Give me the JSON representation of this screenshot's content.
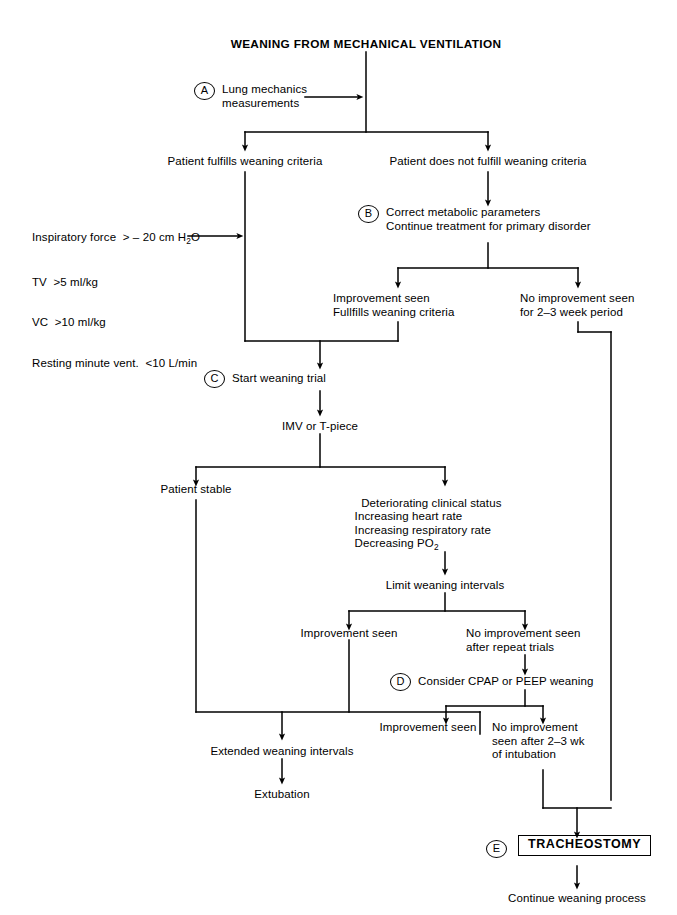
{
  "diagram": {
    "title": "WEANING FROM MECHANICAL VENTILATION",
    "type": "clinical-algorithm-flowchart",
    "markers": {
      "a": "A",
      "b": "B",
      "c": "C",
      "d": "D",
      "e": "E"
    },
    "nodes": {
      "lung_mechanics": "Lung mechanics\nmeasurements",
      "fulfills": "Patient fulfills weaning criteria",
      "not_fulfills": "Patient does not fulfill weaning criteria",
      "criteria_line1": "Inspiratory force  > – 20 cm H",
      "criteria_line1_sub": "2",
      "criteria_line1_end": "O",
      "criteria_line2": "TV  >5 ml/kg",
      "criteria_line3": "VC  >10 ml/kg",
      "criteria_line4": "Resting minute vent.  <10 L/min",
      "correct_metabolic": "Correct metabolic parameters\nContinue treatment for primary disorder",
      "improvement_fulfills": "Improvement seen\nFullfills weaning criteria",
      "no_improvement_weeks": "No improvement seen\nfor 2–3 week period",
      "start_weaning": "Start weaning trial",
      "imv": "IMV or T-piece",
      "patient_stable": "Patient stable",
      "deteriorating": "Deteriorating clinical status\n  Increasing heart rate\n  Increasing respiratory rate\n  Decreasing PO",
      "deteriorating_sub": "2",
      "limit_weaning": "Limit weaning intervals",
      "improvement_seen_1": "Improvement seen",
      "no_improvement_repeat": "No improvement seen\nafter repeat trials",
      "consider_cpap": "Consider CPAP or PEEP weaning",
      "improvement_seen_2": "Improvement seen",
      "no_improvement_intubation": "No improvement\nseen after 2–3 wk\nof intubation",
      "extended_weaning": "Extended weaning intervals",
      "extubation": "Extubation",
      "tracheostomy": "TRACHEOSTOMY",
      "continue_weaning": "Continue weaning process"
    },
    "colors": {
      "line": "#000000",
      "text": "#000000",
      "background": "#ffffff"
    }
  }
}
